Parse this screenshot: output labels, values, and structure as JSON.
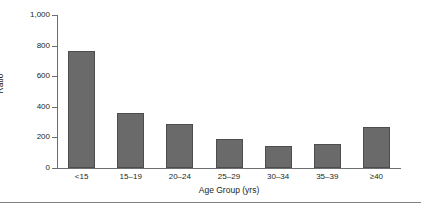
{
  "chart_data": {
    "type": "bar",
    "title": "",
    "xlabel": "Age Group (yrs)",
    "ylabel": "Ratio",
    "categories": [
      "<15",
      "15–19",
      "20–24",
      "25–29",
      "30–34",
      "35–39",
      "≥40"
    ],
    "values": [
      765,
      358,
      285,
      188,
      143,
      160,
      267
    ],
    "ylim": [
      0,
      1000
    ],
    "yticks": [
      0,
      200,
      400,
      600,
      800,
      1000
    ],
    "ytick_labels": [
      "0",
      "200",
      "400",
      "600",
      "800",
      "1,000"
    ],
    "grid": false,
    "legend": null,
    "bar_color": "#6a6a6a",
    "axis_color": "#6d6e71"
  },
  "figure": {
    "has_bottom_rule": true
  }
}
